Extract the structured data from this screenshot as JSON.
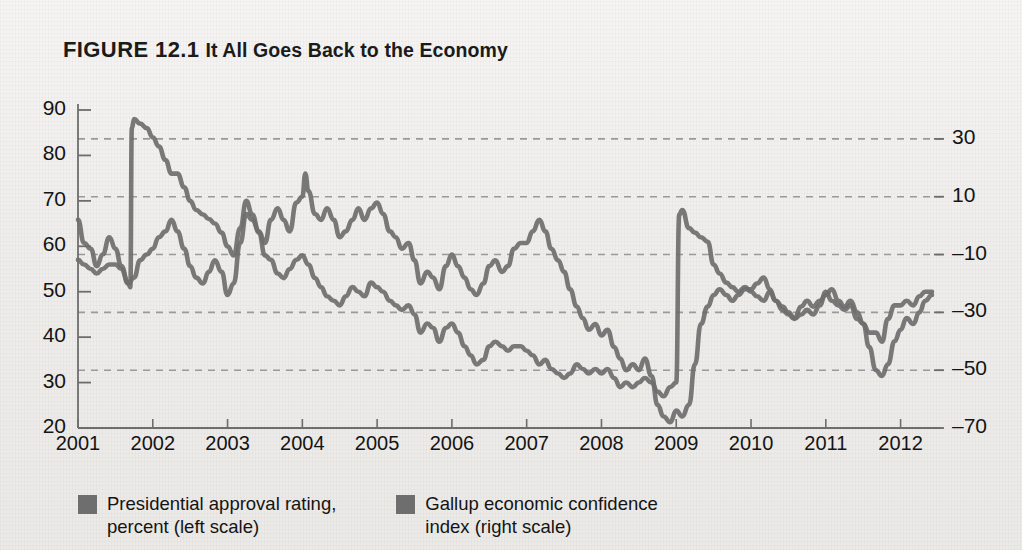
{
  "figure": {
    "label": "FIGURE 12.1",
    "title": "It All Goes Back to the Economy"
  },
  "legend": {
    "items": [
      {
        "label": "Presidential approval rating,\npercent (left scale)",
        "color": "#6e6e6e"
      },
      {
        "label": "Gallup economic confidence\nindex (right scale)",
        "color": "#6e6e6e"
      }
    ]
  },
  "chart_data": {
    "type": "line",
    "title": "FIGURE 12.1 It All Goes Back to the Economy",
    "xlabel": "",
    "ylabel": "Presidential approval rating, percent (left scale)",
    "y2label": "Gallup economic confidence index (right scale)",
    "grid": true,
    "legend_position": "bottom-left",
    "xlim": [
      2001.0,
      2012.42
    ],
    "ylim": [
      20,
      90
    ],
    "y2lim": [
      -70,
      40
    ],
    "xticks": [
      "2001",
      "2002",
      "2003",
      "2004",
      "2005",
      "2006",
      "2007",
      "2008",
      "2009",
      "2010",
      "2011",
      "2012"
    ],
    "xtick_values": [
      2001,
      2002,
      2003,
      2004,
      2005,
      2006,
      2007,
      2008,
      2009,
      2010,
      2011,
      2012
    ],
    "yticks": [
      20,
      30,
      40,
      50,
      60,
      70,
      80,
      90
    ],
    "y2ticks": [
      -70,
      -50,
      -30,
      -10,
      10,
      30
    ],
    "series": [
      {
        "name": "Presidential approval rating, percent (left scale)",
        "axis": "left",
        "color": "#6e6e6e",
        "x": [
          2001.0,
          2001.08,
          2001.17,
          2001.25,
          2001.33,
          2001.42,
          2001.5,
          2001.58,
          2001.67,
          2001.7,
          2001.72,
          2001.75,
          2001.83,
          2001.92,
          2002.0,
          2002.08,
          2002.17,
          2002.25,
          2002.33,
          2002.42,
          2002.5,
          2002.58,
          2002.67,
          2002.75,
          2002.83,
          2002.92,
          2003.0,
          2003.08,
          2003.17,
          2003.25,
          2003.33,
          2003.42,
          2003.5,
          2003.58,
          2003.67,
          2003.75,
          2003.83,
          2003.92,
          2004.0,
          2004.08,
          2004.17,
          2004.25,
          2004.33,
          2004.42,
          2004.5,
          2004.58,
          2004.67,
          2004.75,
          2004.83,
          2004.92,
          2005.0,
          2005.08,
          2005.17,
          2005.25,
          2005.33,
          2005.42,
          2005.5,
          2005.58,
          2005.67,
          2005.75,
          2005.83,
          2005.92,
          2006.0,
          2006.08,
          2006.17,
          2006.25,
          2006.33,
          2006.42,
          2006.5,
          2006.58,
          2006.67,
          2006.75,
          2006.83,
          2006.92,
          2007.0,
          2007.08,
          2007.17,
          2007.25,
          2007.33,
          2007.42,
          2007.5,
          2007.58,
          2007.67,
          2007.75,
          2007.83,
          2007.92,
          2008.0,
          2008.08,
          2008.17,
          2008.25,
          2008.33,
          2008.42,
          2008.5,
          2008.58,
          2008.67,
          2008.75,
          2008.83,
          2008.92,
          2009.0,
          2009.04,
          2009.08,
          2009.17,
          2009.25,
          2009.33,
          2009.42,
          2009.5,
          2009.58,
          2009.67,
          2009.75,
          2009.83,
          2009.92,
          2010.0,
          2010.08,
          2010.17,
          2010.25,
          2010.33,
          2010.42,
          2010.5,
          2010.58,
          2010.67,
          2010.75,
          2010.83,
          2010.92,
          2011.0,
          2011.08,
          2011.17,
          2011.25,
          2011.33,
          2011.42,
          2011.5,
          2011.58,
          2011.67,
          2011.75,
          2011.83,
          2011.92,
          2012.0,
          2012.08,
          2012.17,
          2012.25,
          2012.33,
          2012.42
        ],
        "y": [
          57,
          56,
          55,
          54,
          55,
          56,
          56,
          55,
          52,
          51,
          86,
          88,
          87,
          86,
          84,
          82,
          79,
          76,
          76,
          73,
          70,
          68,
          67,
          66,
          65,
          63,
          60,
          58,
          64,
          70,
          67,
          63,
          58,
          57,
          54,
          53,
          55,
          57,
          58,
          56,
          53,
          51,
          49,
          48,
          47,
          49,
          51,
          50,
          49,
          52,
          51,
          50,
          48,
          47,
          46,
          47,
          45,
          41,
          43,
          42,
          39,
          42,
          43,
          41,
          38,
          36,
          34,
          35,
          38,
          39,
          38,
          37,
          38,
          38,
          37,
          36,
          34,
          35,
          33,
          32,
          31,
          32,
          34,
          33,
          32,
          33,
          32,
          33,
          31,
          29,
          30,
          29,
          30,
          31,
          30,
          28,
          27,
          29,
          30,
          67,
          68,
          64,
          63,
          62,
          61,
          56,
          54,
          52,
          51,
          50,
          51,
          50,
          49,
          48,
          50,
          48,
          46,
          45,
          44,
          45,
          46,
          45,
          47,
          50,
          48,
          47,
          46,
          47,
          44,
          43,
          41,
          41,
          39,
          44,
          47,
          47,
          48,
          47,
          49,
          50,
          50
        ]
      },
      {
        "name": "Gallup economic confidence index (right scale)",
        "axis": "right",
        "color": "#6e6e6e",
        "x": [
          2001.0,
          2001.08,
          2001.17,
          2001.25,
          2001.33,
          2001.42,
          2001.5,
          2001.58,
          2001.67,
          2001.75,
          2001.83,
          2001.92,
          2002.0,
          2002.08,
          2002.17,
          2002.25,
          2002.33,
          2002.42,
          2002.5,
          2002.58,
          2002.67,
          2002.75,
          2002.83,
          2002.92,
          2003.0,
          2003.08,
          2003.17,
          2003.25,
          2003.33,
          2003.42,
          2003.5,
          2003.58,
          2003.67,
          2003.75,
          2003.83,
          2003.92,
          2004.0,
          2004.04,
          2004.08,
          2004.17,
          2004.25,
          2004.33,
          2004.42,
          2004.5,
          2004.58,
          2004.67,
          2004.75,
          2004.83,
          2004.92,
          2005.0,
          2005.08,
          2005.17,
          2005.25,
          2005.33,
          2005.42,
          2005.5,
          2005.58,
          2005.67,
          2005.75,
          2005.83,
          2005.92,
          2006.0,
          2006.08,
          2006.17,
          2006.25,
          2006.33,
          2006.42,
          2006.5,
          2006.58,
          2006.67,
          2006.75,
          2006.83,
          2006.92,
          2007.0,
          2007.08,
          2007.17,
          2007.25,
          2007.33,
          2007.42,
          2007.5,
          2007.58,
          2007.67,
          2007.75,
          2007.83,
          2007.92,
          2008.0,
          2008.08,
          2008.17,
          2008.25,
          2008.33,
          2008.42,
          2008.5,
          2008.58,
          2008.67,
          2008.75,
          2008.83,
          2008.92,
          2009.0,
          2009.08,
          2009.17,
          2009.25,
          2009.33,
          2009.42,
          2009.5,
          2009.58,
          2009.67,
          2009.75,
          2009.83,
          2009.92,
          2010.0,
          2010.08,
          2010.17,
          2010.25,
          2010.33,
          2010.42,
          2010.5,
          2010.58,
          2010.67,
          2010.75,
          2010.83,
          2010.92,
          2011.0,
          2011.08,
          2011.17,
          2011.25,
          2011.33,
          2011.42,
          2011.5,
          2011.58,
          2011.67,
          2011.75,
          2011.83,
          2011.92,
          2012.0,
          2012.08,
          2012.17,
          2012.25,
          2012.33,
          2012.42
        ],
        "y": [
          2,
          -6,
          -8,
          -14,
          -10,
          -4,
          -8,
          -14,
          -20,
          -18,
          -12,
          -10,
          -8,
          -4,
          -2,
          2,
          -2,
          -8,
          -14,
          -18,
          -20,
          -16,
          -12,
          -16,
          -24,
          -20,
          -6,
          4,
          2,
          -2,
          -6,
          2,
          6,
          2,
          -2,
          8,
          10,
          18,
          12,
          4,
          2,
          6,
          2,
          -4,
          -2,
          2,
          6,
          2,
          6,
          8,
          4,
          -2,
          -4,
          -8,
          -6,
          -12,
          -20,
          -16,
          -18,
          -22,
          -14,
          -10,
          -14,
          -18,
          -22,
          -24,
          -20,
          -14,
          -12,
          -16,
          -14,
          -8,
          -6,
          -6,
          -2,
          2,
          -2,
          -8,
          -12,
          -16,
          -22,
          -28,
          -32,
          -36,
          -34,
          -38,
          -36,
          -42,
          -46,
          -50,
          -48,
          -50,
          -46,
          -52,
          -62,
          -66,
          -68,
          -64,
          -66,
          -62,
          -48,
          -34,
          -28,
          -24,
          -22,
          -24,
          -26,
          -24,
          -22,
          -22,
          -20,
          -18,
          -22,
          -26,
          -28,
          -30,
          -32,
          -28,
          -26,
          -28,
          -26,
          -24,
          -22,
          -26,
          -28,
          -26,
          -30,
          -34,
          -42,
          -50,
          -52,
          -48,
          -40,
          -36,
          -32,
          -34,
          -30,
          -26,
          -24
        ]
      }
    ]
  },
  "axis_geometry": {
    "plot_left": 78,
    "plot_right": 932,
    "plot_top": 110,
    "plot_bottom": 428
  }
}
